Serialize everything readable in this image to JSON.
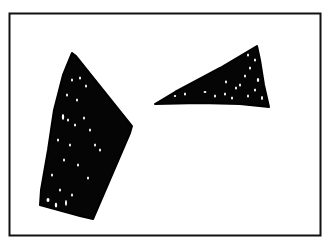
{
  "figure": {
    "ink_color": "#000000",
    "background_color": "#ffffff",
    "shapes": [
      {
        "name": "left-quadrilateral",
        "kind": "quadrilateral",
        "fill": "hatched-black"
      },
      {
        "name": "right-triangle",
        "kind": "triangle",
        "fill": "hatched-black"
      }
    ]
  }
}
